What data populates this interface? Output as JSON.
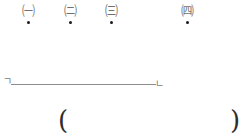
{
  "figure": {
    "markers": [
      {
        "label": "㈠",
        "letter": "ㄱ",
        "x": 17
      },
      {
        "label": "㈡",
        "letter": "ㄴ",
        "x": 59
      },
      {
        "label": "㈢",
        "letter": "ㄷ",
        "x": 100
      },
      {
        "label": "㈣",
        "letter": "ㄹ",
        "x": 176
      }
    ],
    "segment": {
      "left_label": "ㄱ",
      "right_label": "ㄴ"
    },
    "answer_blank": {
      "open": "(",
      "close": ")"
    }
  }
}
